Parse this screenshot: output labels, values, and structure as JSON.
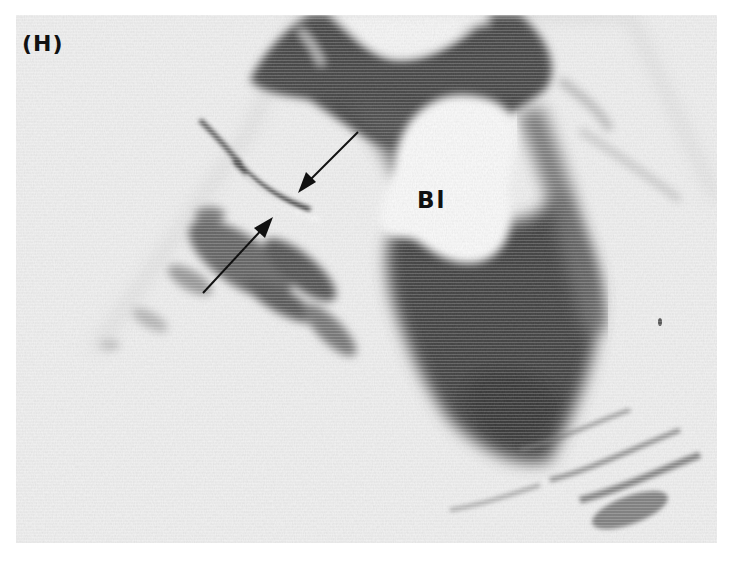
{
  "figure": {
    "panel_label": "(H)",
    "structure_label": "Bl",
    "image_type": "grayscale ultrasound scan",
    "annotations": [
      {
        "type": "arrow",
        "direction": "down-left",
        "from": [
          358,
          132
        ],
        "to": [
          298,
          192
        ]
      },
      {
        "type": "arrow",
        "direction": "up-right",
        "from": [
          203,
          293
        ],
        "to": [
          273,
          217
        ]
      }
    ],
    "colors": {
      "background": "#ececec",
      "page": "#ffffff",
      "tissue_dark": "#3a3a3a",
      "tissue_mid": "#7a7a7a",
      "fluid": "#f4f4f4",
      "annotation": "#111111"
    }
  }
}
